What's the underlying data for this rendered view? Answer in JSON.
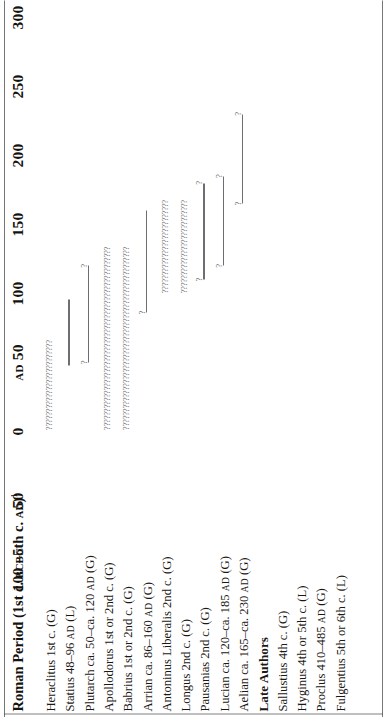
{
  "figure": {
    "period_heading": "Roman Period (1st c. BC–5th c. AD)",
    "period_heading_note": "1",
    "section_heading": "Late Authors"
  },
  "axis": {
    "ticks": [
      {
        "label": "100",
        "era": "BC",
        "value": -100
      },
      {
        "label": "50",
        "era": "",
        "value": -50
      },
      {
        "label": "0",
        "era": "",
        "value": 0
      },
      {
        "label": "50",
        "era": "AD",
        "era_before": true,
        "value": 50
      },
      {
        "label": "100",
        "era": "",
        "value": 100
      },
      {
        "label": "150",
        "era": "",
        "value": 150
      },
      {
        "label": "200",
        "era": "",
        "value": 200
      },
      {
        "label": "250",
        "era": "",
        "value": 250
      },
      {
        "label": "300",
        "era": "",
        "value": 300
      }
    ],
    "range": [
      -100,
      300
    ]
  },
  "chart_data": {
    "type": "bar",
    "title": "Roman Period (1st c. BC–5th c. AD)",
    "xlabel": "",
    "ylabel": "",
    "xlim": [
      -100,
      300
    ],
    "grid": false,
    "legend": "none",
    "orientation": "horizontal-ranges",
    "categories": [
      "Heraclitus 1st c. (G)",
      "Statius 48–96 AD (L)",
      "Plutarch ca. 50–ca. 120 AD (G)",
      "Apollodorus 1st or 2nd c. (G)",
      "Babrius 1st or 2nd c. (G)",
      "Arrian ca. 86–160 AD (G)",
      "Antoninus Liberalis 2nd c. (G)",
      "Longus 2nd c. (G)",
      "Pausanias 2nd c. (G)",
      "Lucian ca. 120–ca. 185 AD (G)",
      "Aelian ca. 165–ca. 230 AD (G)",
      "Sallustius 4th c. (G)",
      "Hyginus 4th or 5th c. (L)",
      "Proclus 410–485 AD (G)",
      "Fulgentius 5th or 6th c. (L)"
    ],
    "ranges": [
      {
        "name": "Heraclitus",
        "start": 1,
        "end": 100,
        "certain": false,
        "cap_start": "?",
        "cap_end": "?"
      },
      {
        "name": "Statius",
        "start": 48,
        "end": 96,
        "certain": true,
        "cap_start": "",
        "cap_end": ""
      },
      {
        "name": "Plutarch",
        "start": 50,
        "end": 120,
        "certain": true,
        "cap_start": "?",
        "cap_end": "?"
      },
      {
        "name": "Apollodorus",
        "start": 1,
        "end": 200,
        "certain": false,
        "cap_start": "?",
        "cap_end": "?"
      },
      {
        "name": "Babrius",
        "start": 1,
        "end": 200,
        "certain": false,
        "cap_start": "?",
        "cap_end": "?"
      },
      {
        "name": "Arrian",
        "start": 86,
        "end": 160,
        "certain": true,
        "cap_start": "?",
        "cap_end": ""
      },
      {
        "name": "Antoninus Liberalis",
        "start": 100,
        "end": 200,
        "certain": false,
        "cap_start": "?",
        "cap_end": "?"
      },
      {
        "name": "Longus",
        "start": 100,
        "end": 200,
        "certain": false,
        "cap_start": "?",
        "cap_end": "?"
      },
      {
        "name": "Pausanias",
        "start": 110,
        "end": 180,
        "certain": true,
        "cap_start": "?",
        "cap_end": "?"
      },
      {
        "name": "Lucian",
        "start": 120,
        "end": 185,
        "certain": true,
        "cap_start": "?",
        "cap_end": "?"
      },
      {
        "name": "Aelian",
        "start": 165,
        "end": 230,
        "certain": true,
        "cap_start": "?",
        "cap_end": "?"
      },
      {
        "name": "Sallustius",
        "start": null,
        "end": null,
        "certain": false,
        "cap_start": "",
        "cap_end": ""
      },
      {
        "name": "Hyginus",
        "start": null,
        "end": null,
        "certain": false,
        "cap_start": "",
        "cap_end": ""
      },
      {
        "name": "Proclus",
        "start": null,
        "end": null,
        "certain": false,
        "cap_start": "",
        "cap_end": ""
      },
      {
        "name": "Fulgentius",
        "start": null,
        "end": null,
        "certain": false,
        "cap_start": "",
        "cap_end": ""
      }
    ],
    "uncertainty_marker": "?"
  },
  "rows": [
    {
      "name": "Heraclitus",
      "dates": "1st c.",
      "lang": "(G)",
      "sc": "",
      "section": false
    },
    {
      "name": "Statius",
      "dates": "48–96",
      "lang": "(L)",
      "sc": "AD",
      "section": false
    },
    {
      "name": "Plutarch",
      "dates": "ca. 50–ca. 120",
      "lang": "(G)",
      "sc": "AD",
      "section": false
    },
    {
      "name": "Apollodorus",
      "dates": "1st or 2nd c.",
      "lang": "(G)",
      "sc": "",
      "section": false
    },
    {
      "name": "Babrius",
      "dates": "1st or 2nd c.",
      "lang": "(G)",
      "sc": "",
      "section": false
    },
    {
      "name": "Arrian",
      "dates": "ca. 86–160",
      "lang": "(G)",
      "sc": "AD",
      "section": false
    },
    {
      "name": "Antoninus Liberalis",
      "dates": "2nd c.",
      "lang": "(G)",
      "sc": "",
      "section": false
    },
    {
      "name": "Longus",
      "dates": "2nd c.",
      "lang": "(G)",
      "sc": "",
      "section": false
    },
    {
      "name": "Pausanias",
      "dates": "2nd c.",
      "lang": "(G)",
      "sc": "",
      "section": false
    },
    {
      "name": "Lucian",
      "dates": "ca. 120–ca. 185",
      "lang": "(G)",
      "sc": "AD",
      "section": false
    },
    {
      "name": "Aelian",
      "dates": "ca. 165–ca. 230",
      "lang": "(G)",
      "sc": "AD",
      "section": false
    },
    {
      "name": "Late Authors",
      "dates": "",
      "lang": "",
      "sc": "",
      "section": true
    },
    {
      "name": "Sallustius",
      "dates": "4th c.",
      "lang": "(G)",
      "sc": "",
      "section": false
    },
    {
      "name": "Hyginus",
      "dates": "4th or 5th c.",
      "lang": "(L)",
      "sc": "",
      "section": false
    },
    {
      "name": "Proclus",
      "dates": "410–485",
      "lang": "(G)",
      "sc": "AD",
      "section": false
    },
    {
      "name": "Fulgentius",
      "dates": "5th or 6th c.",
      "lang": "(L)",
      "sc": "",
      "section": false
    }
  ]
}
